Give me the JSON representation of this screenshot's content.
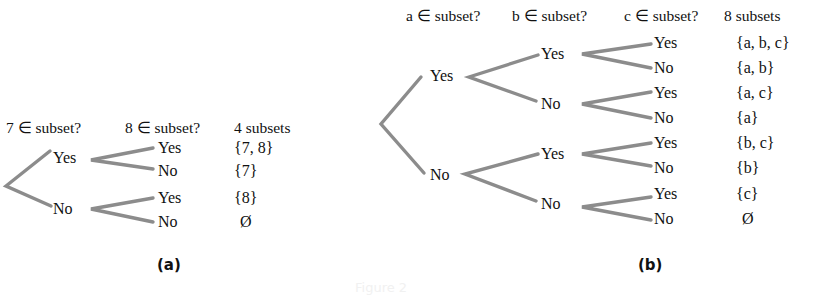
{
  "figure_a": {
    "headers": [
      "7 ∈ subset?",
      "8 ∈ subset?",
      "4 subsets"
    ],
    "level1": [
      "Yes",
      "No"
    ],
    "level2": [
      "Yes",
      "No",
      "Yes",
      "No"
    ],
    "subsets": [
      "{7, 8}",
      "{7}",
      "{8}",
      "Ø"
    ],
    "caption": "(a)"
  },
  "figure_b": {
    "headers": [
      "a ∈ subset?",
      "b ∈ subset?",
      "c ∈ subset?",
      "8 subsets"
    ],
    "level1": [
      "Yes",
      "No"
    ],
    "level2": [
      "Yes",
      "No",
      "Yes",
      "No"
    ],
    "level3": [
      "Yes",
      "No",
      "Yes",
      "No",
      "Yes",
      "No",
      "Yes",
      "No"
    ],
    "subsets": [
      "{a, b, c}",
      "{a, b}",
      "{a, c}",
      "{a}",
      "{b, c}",
      "{b}",
      "{c}",
      "Ø"
    ],
    "caption": "(b)"
  },
  "figure_caption": "Figure 2"
}
